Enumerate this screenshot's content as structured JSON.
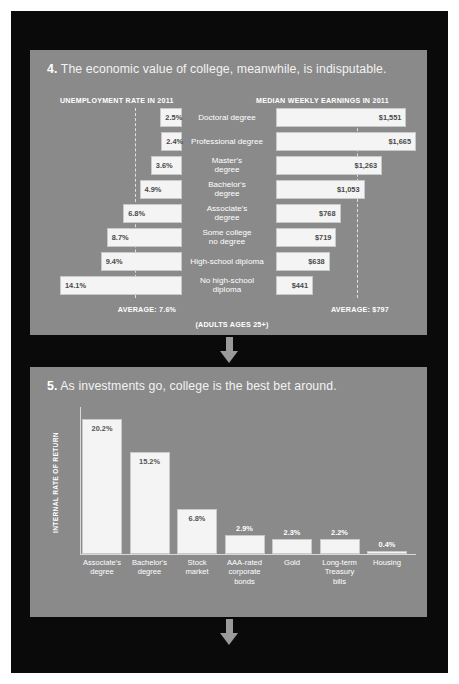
{
  "panel4": {
    "number": "4.",
    "headline": "The economic value of college, meanwhile, is indisputable.",
    "left_header": "UNEMPLOYMENT RATE IN 2011",
    "right_header": "MEDIAN WEEKLY EARNINGS IN 2011",
    "left_average_label": "AVERAGE: 7.6%",
    "right_average_label": "AVERAGE: $797",
    "footnote": "(ADULTS AGES 25+)"
  },
  "panel5": {
    "number": "5.",
    "headline": "As investments go, college is the best bet around.",
    "ylabel": "INTERNAL RATE OF RETURN"
  },
  "chart_data": [
    {
      "type": "bar",
      "orientation": "horizontal-diverging",
      "title": "The economic value of college, meanwhile, is indisputable.",
      "subtitle": "(ADULTS AGES 25+)",
      "categories": [
        "Doctoral degree",
        "Professional degree",
        "Master's degree",
        "Bachelor's degree",
        "Associate's degree",
        "Some college no degree",
        "High-school diploma",
        "No high-school diploma"
      ],
      "series": [
        {
          "name": "UNEMPLOYMENT RATE IN 2011",
          "unit": "%",
          "labels": [
            "2.5%",
            "2.4%",
            "3.6%",
            "4.9%",
            "6.8%",
            "8.7%",
            "9.4%",
            "14.1%"
          ],
          "values": [
            2.5,
            2.4,
            3.6,
            4.9,
            6.8,
            8.7,
            9.4,
            14.1
          ],
          "average": 7.6,
          "average_label": "AVERAGE: 7.6%"
        },
        {
          "name": "MEDIAN WEEKLY EARNINGS IN 2011",
          "unit": "USD",
          "labels": [
            "$1,551",
            "$1,665",
            "$1,263",
            "$1,053",
            "$768",
            "$719",
            "$638",
            "$441"
          ],
          "values": [
            1551,
            1665,
            1263,
            1053,
            768,
            719,
            638,
            441
          ],
          "average": 797,
          "average_label": "AVERAGE: $797"
        }
      ],
      "grid": false,
      "legend": "none"
    },
    {
      "type": "bar",
      "orientation": "vertical",
      "title": "As investments go, college is the best bet around.",
      "ylabel": "INTERNAL RATE OF RETURN",
      "xlabel": "",
      "categories": [
        "Associate's degree",
        "Bachelor's degree",
        "Stock market",
        "AAA-rated corporate bonds",
        "Gold",
        "Long-term Treasury bills",
        "Housing"
      ],
      "labels": [
        "20.2%",
        "15.2%",
        "6.8%",
        "2.9%",
        "2.3%",
        "2.2%",
        "0.4%"
      ],
      "values": [
        20.2,
        15.2,
        6.8,
        2.9,
        2.3,
        2.2,
        0.4
      ],
      "ylim": [
        0,
        22
      ],
      "grid": false,
      "legend": "none"
    }
  ],
  "categories4": [
    {
      "label": "Doctoral degree",
      "unemp": "2.5%",
      "earn": "$1,551"
    },
    {
      "label": "Professional degree",
      "unemp": "2.4%",
      "earn": "$1,665"
    },
    {
      "label": "Master's\ndegree",
      "unemp": "3.6%",
      "earn": "$1,263"
    },
    {
      "label": "Bachelor's\ndegree",
      "unemp": "4.9%",
      "earn": "$1,053"
    },
    {
      "label": "Associate's\ndegree",
      "unemp": "6.8%",
      "earn": "$768"
    },
    {
      "label": "Some college\nno degree",
      "unemp": "8.7%",
      "earn": "$719"
    },
    {
      "label": "High-school diploma",
      "unemp": "9.4%",
      "earn": "$638"
    },
    {
      "label": "No high-school\ndiploma",
      "unemp": "14.1%",
      "earn": "$441"
    }
  ],
  "categories5": [
    {
      "label": "Associate's\ndegree",
      "value": "20.2%"
    },
    {
      "label": "Bachelor's\ndegree",
      "value": "15.2%"
    },
    {
      "label": "Stock\nmarket",
      "value": "6.8%"
    },
    {
      "label": "AAA-rated\ncorporate\nbonds",
      "value": "2.9%"
    },
    {
      "label": "Gold",
      "value": "2.3%"
    },
    {
      "label": "Long-term\nTreasury\nbills",
      "value": "2.2%"
    },
    {
      "label": "Housing",
      "value": "0.4%"
    }
  ],
  "colors": {
    "background": "#ffffff",
    "frame": "#0a0a0a",
    "panel": "#8a8a8a",
    "bar": "#f4f4f4",
    "text_light": "#ffffff",
    "text_dark": "#4a4a4a",
    "arrow": "#9a9a9a"
  },
  "icons": {
    "connector": "arrow-down-icon"
  }
}
